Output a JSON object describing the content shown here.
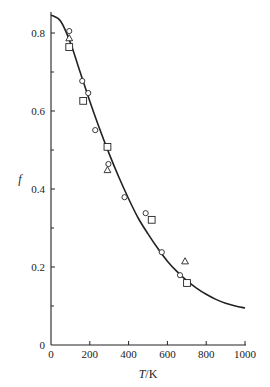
{
  "chart_data": {
    "type": "scatter",
    "title": "",
    "xlabel": "T/K",
    "ylabel": "f",
    "xlim": [
      0,
      1000
    ],
    "ylim": [
      0,
      0.85
    ],
    "grid": false,
    "legend": null,
    "x_ticks": [
      0,
      200,
      400,
      600,
      800,
      1000
    ],
    "x_tick_labels": [
      "0",
      "200",
      "400",
      "600",
      "800",
      "1000"
    ],
    "y_ticks": [
      0,
      0.2,
      0.4,
      0.6,
      0.8
    ],
    "y_tick_labels": [
      "0",
      "0.2",
      "0.4",
      "0.6",
      "0.8"
    ],
    "y_minor_ticks": [
      0.1,
      0.3,
      0.5,
      0.7
    ],
    "series": [
      {
        "name": "circles",
        "marker": "circle",
        "points": [
          {
            "x": 94,
            "y": 0.805
          },
          {
            "x": 161,
            "y": 0.677
          },
          {
            "x": 192,
            "y": 0.646
          },
          {
            "x": 228,
            "y": 0.551
          },
          {
            "x": 296,
            "y": 0.464
          },
          {
            "x": 379,
            "y": 0.379
          },
          {
            "x": 488,
            "y": 0.338
          },
          {
            "x": 571,
            "y": 0.238
          },
          {
            "x": 665,
            "y": 0.179
          }
        ]
      },
      {
        "name": "triangles",
        "marker": "triangle",
        "points": [
          {
            "x": 94,
            "y": 0.787
          },
          {
            "x": 291,
            "y": 0.449
          },
          {
            "x": 691,
            "y": 0.215
          }
        ]
      },
      {
        "name": "squares",
        "marker": "square",
        "points": [
          {
            "x": 94,
            "y": 0.764
          },
          {
            "x": 166,
            "y": 0.626
          },
          {
            "x": 291,
            "y": 0.508
          },
          {
            "x": 519,
            "y": 0.321
          },
          {
            "x": 701,
            "y": 0.159
          }
        ]
      },
      {
        "name": "theory curve",
        "marker": "line",
        "points": [
          {
            "x": 0,
            "y": 0.846
          },
          {
            "x": 50,
            "y": 0.83
          },
          {
            "x": 100,
            "y": 0.775
          },
          {
            "x": 150,
            "y": 0.7
          },
          {
            "x": 200,
            "y": 0.625
          },
          {
            "x": 250,
            "y": 0.555
          },
          {
            "x": 300,
            "y": 0.49
          },
          {
            "x": 350,
            "y": 0.43
          },
          {
            "x": 400,
            "y": 0.375
          },
          {
            "x": 450,
            "y": 0.325
          },
          {
            "x": 500,
            "y": 0.285
          },
          {
            "x": 550,
            "y": 0.248
          },
          {
            "x": 600,
            "y": 0.215
          },
          {
            "x": 650,
            "y": 0.188
          },
          {
            "x": 700,
            "y": 0.165
          },
          {
            "x": 750,
            "y": 0.146
          },
          {
            "x": 800,
            "y": 0.13
          },
          {
            "x": 850,
            "y": 0.117
          },
          {
            "x": 900,
            "y": 0.107
          },
          {
            "x": 950,
            "y": 0.1
          },
          {
            "x": 1000,
            "y": 0.095
          }
        ]
      }
    ]
  },
  "colors": {
    "ink": "#222222",
    "background": "#ffffff"
  }
}
